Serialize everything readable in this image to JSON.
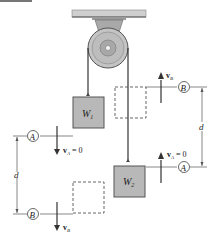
{
  "figure": {
    "type": "pulley-system",
    "masses": [
      {
        "id": "W1",
        "label": "W",
        "subscript": "1"
      },
      {
        "id": "W2",
        "label": "W",
        "subscript": "2"
      }
    ],
    "positions": {
      "A": "A",
      "B": "B"
    },
    "velocities": {
      "vA_left": {
        "symbol": "v",
        "subscript": "A",
        "value": "= 0"
      },
      "vB_left": {
        "symbol": "v",
        "subscript": "B"
      },
      "vA_right": {
        "symbol": "v",
        "subscript": "A",
        "value": "= 0"
      },
      "vB_right": {
        "symbol": "v",
        "subscript": "B"
      }
    },
    "dimension_labels": {
      "left_d": "d",
      "right_d": "d"
    },
    "colors": {
      "block_fill": "#b8b8b8",
      "block_stroke": "#555555",
      "pulley_fill": "#bdbdbd",
      "ceiling_fill": "#cfcfcf",
      "line": "#333333",
      "dashed": "#555555"
    }
  }
}
